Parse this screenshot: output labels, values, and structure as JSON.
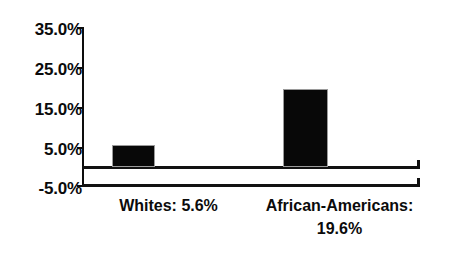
{
  "chart_data": {
    "type": "bar",
    "title": "",
    "subtitle": "",
    "xlabel": "",
    "ylabel": "",
    "categories": [
      "Whites",
      "African-Americans"
    ],
    "values": [
      5.6,
      19.6
    ],
    "value_labels": [
      "5.6%",
      "19.6%"
    ],
    "category_labels": [
      "Whites: 5.6%",
      "African-Americans:\n19.6%"
    ],
    "ylim": [
      -5.0,
      35.0
    ],
    "ytick_values": [
      35.0,
      25.0,
      15.0,
      5.0,
      -5.0
    ],
    "ytick_labels": [
      "35.0%",
      "25.0%",
      "15.0%",
      "5.0%",
      "-5.0%"
    ],
    "grid": false,
    "legend": false,
    "legend_position": "none",
    "bar_color": "#080808",
    "axis_color": "#111111",
    "text_color": "#0b0b0b",
    "background_color": "#ffffff",
    "series": [
      {
        "name": "",
        "values": [
          5.6,
          19.6
        ]
      }
    ]
  }
}
